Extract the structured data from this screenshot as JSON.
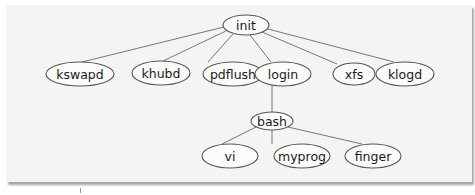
{
  "diagram": {
    "type": "process-tree",
    "nodes": [
      {
        "id": "init",
        "label": "init",
        "cx": 246,
        "cy": 25,
        "rx": 23,
        "ry": 10
      },
      {
        "id": "kswapd",
        "label": "kswapd",
        "cx": 80,
        "cy": 74,
        "rx": 34,
        "ry": 12
      },
      {
        "id": "khubd",
        "label": "khubd",
        "cx": 161,
        "cy": 73,
        "rx": 29,
        "ry": 12
      },
      {
        "id": "pdflush",
        "label": "pdflush",
        "cx": 233,
        "cy": 74,
        "rx": 30,
        "ry": 12
      },
      {
        "id": "login",
        "label": "login",
        "cx": 283,
        "cy": 74,
        "rx": 28,
        "ry": 12
      },
      {
        "id": "xfs",
        "label": "xfs",
        "cx": 354,
        "cy": 74,
        "rx": 21,
        "ry": 11
      },
      {
        "id": "klogd",
        "label": "klogd",
        "cx": 405,
        "cy": 74,
        "rx": 29,
        "ry": 12
      },
      {
        "id": "bash",
        "label": "bash",
        "cx": 272,
        "cy": 121,
        "rx": 21,
        "ry": 9
      },
      {
        "id": "vi",
        "label": "vi",
        "cx": 230,
        "cy": 156,
        "rx": 28,
        "ry": 12
      },
      {
        "id": "myprog",
        "label": "myprog",
        "cx": 302,
        "cy": 156,
        "rx": 28,
        "ry": 12
      },
      {
        "id": "finger",
        "label": "finger",
        "cx": 373,
        "cy": 156,
        "rx": 28,
        "ry": 12
      }
    ],
    "edges": [
      {
        "from": "init",
        "to": "kswapd",
        "x1": 224,
        "y1": 27,
        "x2": 82,
        "y2": 62
      },
      {
        "from": "init",
        "to": "khubd",
        "x1": 226,
        "y1": 31,
        "x2": 163,
        "y2": 61
      },
      {
        "from": "init",
        "to": "pdflush",
        "x1": 233,
        "y1": 34,
        "x2": 208,
        "y2": 62
      },
      {
        "from": "init",
        "to": "login",
        "x1": 250,
        "y1": 35,
        "x2": 271,
        "y2": 62
      },
      {
        "from": "init",
        "to": "xfs",
        "x1": 262,
        "y1": 32,
        "x2": 337,
        "y2": 64
      },
      {
        "from": "init",
        "to": "klogd",
        "x1": 268,
        "y1": 29,
        "x2": 394,
        "y2": 62
      },
      {
        "from": "login",
        "to": "bash",
        "x1": 272,
        "y1": 86,
        "x2": 272,
        "y2": 112
      },
      {
        "from": "bash",
        "to": "vi",
        "x1": 256,
        "y1": 127,
        "x2": 222,
        "y2": 144
      },
      {
        "from": "bash",
        "to": "myprog",
        "x1": 272,
        "y1": 130,
        "x2": 272,
        "y2": 144
      },
      {
        "from": "bash",
        "to": "finger",
        "x1": 288,
        "y1": 127,
        "x2": 362,
        "y2": 144
      }
    ]
  }
}
